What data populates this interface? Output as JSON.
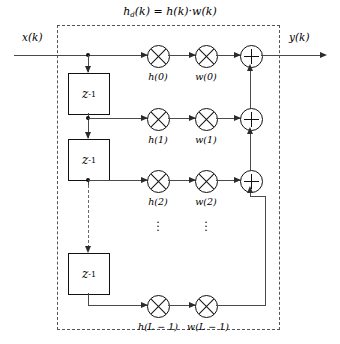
{
  "diagram": {
    "title_equation": {
      "lhs_base": "h",
      "lhs_sub": "d",
      "lhs_arg": "(k) = ",
      "rhs": "h(k)·w(k)",
      "full_text": "h_d(k) = h(k)·w(k)"
    },
    "input_label": "x(k)",
    "output_label": "y(k)",
    "delay_label": "z",
    "delay_exponent": "-1",
    "delay_count": 3,
    "taps": [
      {
        "h": "h(0)",
        "w": "w(0)"
      },
      {
        "h": "h(1)",
        "w": "w(1)"
      },
      {
        "h": "h(2)",
        "w": "w(2)"
      },
      {
        "h": "h(L − 1)",
        "w": "w(L − 1)"
      }
    ],
    "ellipsis": "⋮",
    "operators": {
      "multiply": "⊗",
      "add": "⊕"
    },
    "colors": {
      "wire": "#4a4a4a",
      "outline": "#111111",
      "dashed_border": "#555555",
      "background": "#ffffff"
    }
  }
}
